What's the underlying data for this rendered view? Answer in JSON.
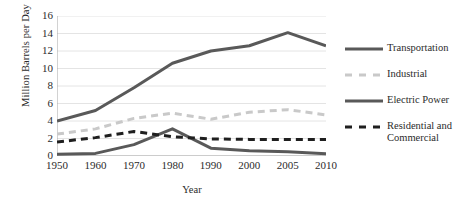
{
  "chart_data": {
    "type": "line",
    "title": "",
    "xlabel": "Year",
    "ylabel": "Million Barrels per Day",
    "categories": [
      "1950",
      "1960",
      "1970",
      "1980",
      "1990",
      "2000",
      "2005",
      "2010"
    ],
    "x_values": [
      1950,
      1960,
      1970,
      1980,
      1990,
      2000,
      2005,
      2010
    ],
    "x_positions_fraction": [
      0.0,
      0.143,
      0.286,
      0.429,
      0.572,
      0.715,
      0.858,
      1.0
    ],
    "ylim": [
      0,
      16
    ],
    "yticks": [
      "0",
      "2",
      "4",
      "6",
      "8",
      "10",
      "12",
      "14",
      "16"
    ],
    "ytick_values": [
      0,
      2,
      4,
      6,
      8,
      10,
      12,
      14,
      16
    ],
    "grid": "horizontal",
    "legend_position": "right",
    "series": [
      {
        "name": "Transportation",
        "style": "solid",
        "color": "#595959",
        "width": 3,
        "values": [
          4.0,
          5.2,
          7.8,
          10.6,
          12.0,
          12.6,
          14.1,
          12.6
        ]
      },
      {
        "name": "Industrial",
        "style": "dashed",
        "color": "#c9c9c9",
        "width": 3,
        "values": [
          2.5,
          3.1,
          4.3,
          4.9,
          4.2,
          5.0,
          5.3,
          4.7
        ]
      },
      {
        "name": "Electric Power",
        "style": "solid",
        "color": "#595959",
        "width": 3,
        "values": [
          0.2,
          0.3,
          1.3,
          3.1,
          0.9,
          0.6,
          0.5,
          0.25
        ]
      },
      {
        "name": "Residential and Commercial",
        "style": "dashed",
        "color": "#1f1f1f",
        "width": 3,
        "values": [
          1.6,
          2.1,
          2.8,
          2.2,
          1.95,
          1.9,
          1.9,
          1.9
        ]
      }
    ]
  },
  "legend": {
    "items": [
      {
        "label": "Transportation"
      },
      {
        "label": "Industrial"
      },
      {
        "label": "Electric Power"
      },
      {
        "label": "Residential and\nCommercial"
      }
    ]
  },
  "colors": {
    "dark_line": "#595959",
    "light_line": "#c9c9c9",
    "black_dash": "#1f1f1f",
    "axis": "#a6a6a6",
    "grid": "#e4e4e4",
    "text": "#2b2b2b",
    "background": "#ffffff"
  }
}
